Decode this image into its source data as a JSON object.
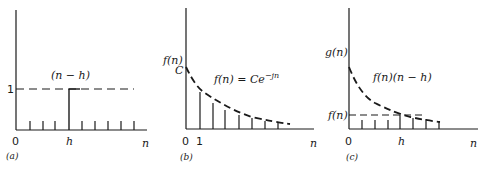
{
  "panels": [
    {
      "id": "a",
      "caption": "(a)",
      "curve_label": "(n − h)",
      "y_tick_label": "1",
      "x_labels": {
        "origin": "0",
        "mark": "h",
        "axis": "n"
      }
    },
    {
      "id": "b",
      "caption": "(b)",
      "y_axis_label": "f(n)",
      "y_tick_label": "C",
      "equation": "f(n) = Ce",
      "equation_exponent": "−jn",
      "x_labels": {
        "origin": "0",
        "mark": "1",
        "axis": "n"
      }
    },
    {
      "id": "c",
      "caption": "(c)",
      "y_axis_label": "g(n)",
      "y_tick_label": "f(n)",
      "curve_label": "f(n)(n − h)",
      "x_labels": {
        "origin": "0",
        "mark": "h",
        "axis": "n"
      }
    }
  ]
}
